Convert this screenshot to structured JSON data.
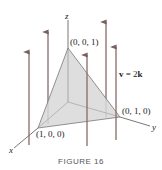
{
  "figure": {
    "caption": "FIGURE 16",
    "axes": {
      "x_label": "x",
      "y_label": "y",
      "z_label": "z"
    },
    "vertices": {
      "top": "(0, 0, 1)",
      "right": "(0, 1, 0)",
      "left": "(1, 0, 0)"
    },
    "vector_field": {
      "lhs": "v",
      "eq": " = 2",
      "rhs": "k"
    },
    "colors": {
      "surface": "#d4d4d4",
      "arrow": "#8a6a6a",
      "axis": "#555555"
    }
  }
}
